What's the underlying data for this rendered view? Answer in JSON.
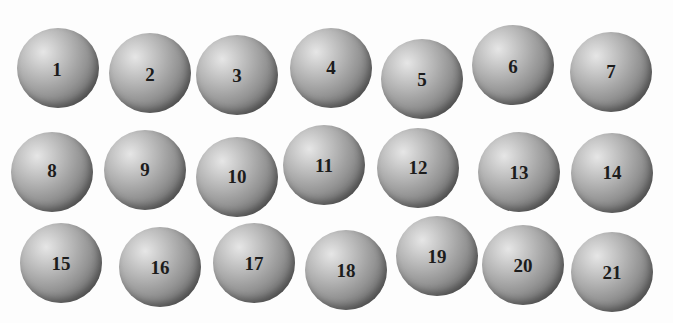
{
  "figure": {
    "background": "#ffffff",
    "sphere_color_highlight": "#e6e6e6",
    "sphere_color_shadow": "#3a3a3a",
    "rows": 3,
    "columns": 7,
    "spheres": [
      {
        "label": "1",
        "cx": 58,
        "cy": 68,
        "dx": -1,
        "dy": 2
      },
      {
        "label": "2",
        "cx": 150,
        "cy": 73,
        "dx": 0,
        "dy": 2
      },
      {
        "label": "3",
        "cx": 237,
        "cy": 75,
        "dx": 0,
        "dy": 1
      },
      {
        "label": "4",
        "cx": 331,
        "cy": 68,
        "dx": 0,
        "dy": 0
      },
      {
        "label": "5",
        "cx": 422,
        "cy": 79,
        "dx": 0,
        "dy": 1
      },
      {
        "label": "6",
        "cx": 513,
        "cy": 65,
        "dx": 0,
        "dy": 2
      },
      {
        "label": "7",
        "cx": 611,
        "cy": 72,
        "dx": 0,
        "dy": 0
      },
      {
        "label": "8",
        "cx": 52,
        "cy": 172,
        "dx": 0,
        "dy": -1
      },
      {
        "label": "9",
        "cx": 145,
        "cy": 170,
        "dx": 0,
        "dy": 0
      },
      {
        "label": "10",
        "cx": 237,
        "cy": 177,
        "dx": 0,
        "dy": 0
      },
      {
        "label": "11",
        "cx": 324,
        "cy": 165,
        "dx": 0,
        "dy": 1
      },
      {
        "label": "12",
        "cx": 418,
        "cy": 168,
        "dx": 0,
        "dy": 0
      },
      {
        "label": "13",
        "cx": 519,
        "cy": 172,
        "dx": 0,
        "dy": 1
      },
      {
        "label": "14",
        "cx": 612,
        "cy": 173,
        "dx": 0,
        "dy": 0
      },
      {
        "label": "15",
        "cx": 61,
        "cy": 263,
        "dx": 0,
        "dy": 1
      },
      {
        "label": "16",
        "cx": 160,
        "cy": 267,
        "dx": 0,
        "dy": 1
      },
      {
        "label": "17",
        "cx": 254,
        "cy": 263,
        "dx": 0,
        "dy": 1
      },
      {
        "label": "18",
        "cx": 346,
        "cy": 270,
        "dx": 0,
        "dy": 1
      },
      {
        "label": "19",
        "cx": 437,
        "cy": 256,
        "dx": 0,
        "dy": 1
      },
      {
        "label": "20",
        "cx": 523,
        "cy": 265,
        "dx": 0,
        "dy": 1
      },
      {
        "label": "21",
        "cx": 612,
        "cy": 272,
        "dx": 0,
        "dy": 1
      }
    ]
  }
}
